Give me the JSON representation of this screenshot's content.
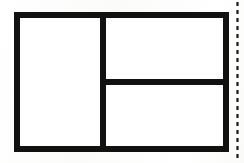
{
  "document": {
    "kind": "scanned-line-drawing",
    "title": "Partitioned rectangle diagram",
    "caption": "",
    "background_color": "#fdfdfc",
    "ink_color": "#111111",
    "panel_fill": "#ffffff",
    "width_px": 244,
    "height_px": 163
  },
  "figure": {
    "name": "partitioned-rectangle",
    "outer_rect": {
      "label": "outer-boundary",
      "x": 17,
      "y": 15,
      "width": 209,
      "height": 134,
      "stroke_width": 6
    },
    "dividers": [
      {
        "name": "vertical-divider",
        "orientation": "vertical",
        "x": 103,
        "y1": 15,
        "y2": 149,
        "stroke_width": 6
      },
      {
        "name": "horizontal-divider",
        "orientation": "horizontal",
        "y": 82,
        "x1": 103,
        "x2": 226,
        "stroke_width": 6
      }
    ],
    "regions": [
      {
        "name": "left-panel",
        "position": "left",
        "fill": "#ffffff",
        "label": ""
      },
      {
        "name": "right-top-panel",
        "position": "upper-right",
        "fill": "#ffffff",
        "label": ""
      },
      {
        "name": "right-bottom-panel",
        "position": "lower-right",
        "fill": "#ffffff",
        "label": ""
      }
    ]
  },
  "artifacts": {
    "perforation_line": {
      "name": "dotted-edge-line",
      "description": "dotted vertical scan artifact near right margin",
      "x": 237,
      "y_start": 2,
      "y_end": 162,
      "dash_length": 4,
      "gap_length": 4,
      "color": "#1a1a1a"
    }
  }
}
